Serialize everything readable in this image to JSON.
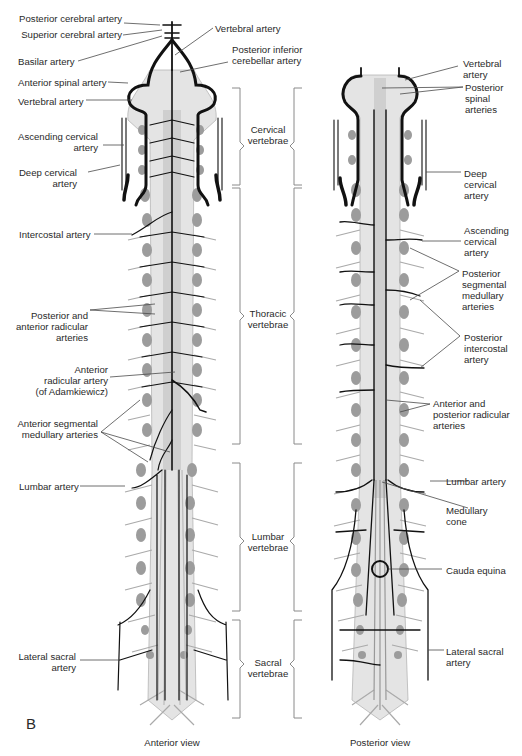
{
  "figure": {
    "panel_letter": "B",
    "views": {
      "anterior": "Anterior view",
      "posterior": "Posterior view"
    },
    "regions": {
      "cervical": "Cervical\nvertebrae",
      "thoracic": "Thoracic\nvertebrae",
      "lumbar": "Lumbar\nvertebrae",
      "sacral": "Sacral\nvertebrae"
    },
    "left_labels": {
      "posterior_cerebral": "Posterior cerebral artery",
      "superior_cerebral": "Superior cerebral artery",
      "basilar": "Basilar artery",
      "anterior_spinal": "Anterior spinal artery",
      "vertebral": "Vertebral artery",
      "ascending_cervical": "Ascending cervical\nartery",
      "deep_cervical": "Deep cervical\nartery",
      "intercostal": "Intercostal artery",
      "post_ant_radicular": "Posterior and\nanterior radicular\narteries",
      "adamkiewicz": "Anterior\nradicular artery\n(of Adamkiewicz)",
      "ant_segmental": "Anterior segmental\nmedullary arteries",
      "lumbar": "Lumbar artery",
      "lateral_sacral": "Lateral sacral\nartery"
    },
    "center_labels": {
      "vertebral": "Vertebral artery",
      "pica": "Posterior inferior\ncerebellar artery"
    },
    "right_labels": {
      "vertebral": "Vertebral\nartery",
      "posterior_spinal": "Posterior\nspinal\narteries",
      "deep_cervical": "Deep\ncervical\nartery",
      "ascending_cervical": "Ascending\ncervical\nartery",
      "post_segmental": "Posterior\nsegmental\nmedullary\narteries",
      "post_intercostal": "Posterior\nintercostal\nartery",
      "ant_post_radicular": "Anterior and\nposterior radicular\narteries",
      "lumbar": "Lumbar artery",
      "medullary_cone": "Medullary\ncone",
      "cauda_equina": "Cauda equina",
      "lateral_sacral": "Lateral sacral\nartery"
    }
  },
  "colors": {
    "ink": "#1a1a1a",
    "cord": "#d6d6d6",
    "vertebra": "#9a9a9a",
    "leader": "#555555",
    "bracket": "#888888"
  }
}
